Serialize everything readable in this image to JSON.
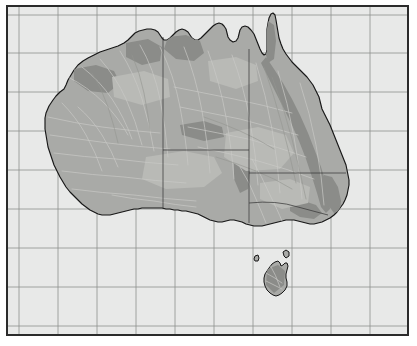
{
  "figure": {
    "type": "physical-relief-map",
    "frame_color": "#2b2b2b",
    "background_color": "#ffffff",
    "ocean_color": "#e8e9e8",
    "land_color": "#a9aaa7",
    "highland_color": "#8b8c89",
    "lowland_color": "#b9bab6",
    "coastline_color": "#171717",
    "grid_color": "#8d8f8d",
    "state_border_color": "#3a3a3a"
  },
  "map_data": {
    "region": "Australia",
    "projection_extent": {
      "left": 0,
      "top": 0,
      "right": 399,
      "bottom": 327
    },
    "graticule": {
      "visible": true,
      "vertical_lines_x": [
        11,
        50,
        89,
        128,
        167,
        206,
        245,
        284,
        323,
        362
      ],
      "horizontal_lines_y": [
        8,
        46,
        85,
        124,
        163,
        202,
        241,
        280,
        319
      ]
    },
    "features": {
      "mainland": "Australian mainland coastline including Cape York Peninsula, Gulf of Carpentaria, Arnhem Land, Great Australian Bight and Eyre Peninsula",
      "islands": [
        "Tasmania",
        "King Island",
        "Flinders Island"
      ],
      "state_borders": [
        "Western Australia / Northern Territory / South Australia",
        "Northern Territory / Queensland / South Australia",
        "South Australia / New South Wales / Victoria",
        "Queensland / New South Wales"
      ],
      "relief": "Great Dividing Range along the east coast shown darker; interior basins and Nullarbor shown lighter"
    },
    "legend": {
      "visible": false
    },
    "labels": {
      "visible": false
    },
    "scale_bar": {
      "visible": false
    },
    "north_arrow": {
      "visible": false
    }
  }
}
